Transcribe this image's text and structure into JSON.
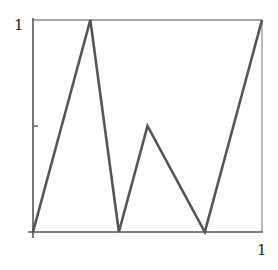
{
  "chart_data": {
    "type": "line",
    "title": "",
    "xlabel": "",
    "ylabel": "",
    "xlim": [
      0,
      1
    ],
    "ylim": [
      0,
      1
    ],
    "grid": false,
    "legend": null,
    "frame": "box",
    "x_tick_labels": [
      {
        "value": 1,
        "label": "1"
      }
    ],
    "y_tick_labels": [
      {
        "value": 1,
        "label": "1"
      }
    ],
    "y_ticks_unlabeled": [
      0.5
    ],
    "series": [
      {
        "name": "piecewise linear function",
        "color": "#555555",
        "x": [
          0,
          0.25,
          0.375,
          0.5,
          0.75,
          1
        ],
        "y": [
          0,
          1,
          0,
          0.5,
          0,
          1
        ]
      }
    ]
  },
  "colors": {
    "frame": "#888888",
    "axis": "#555555",
    "line": "#555555",
    "text": "#222222"
  }
}
